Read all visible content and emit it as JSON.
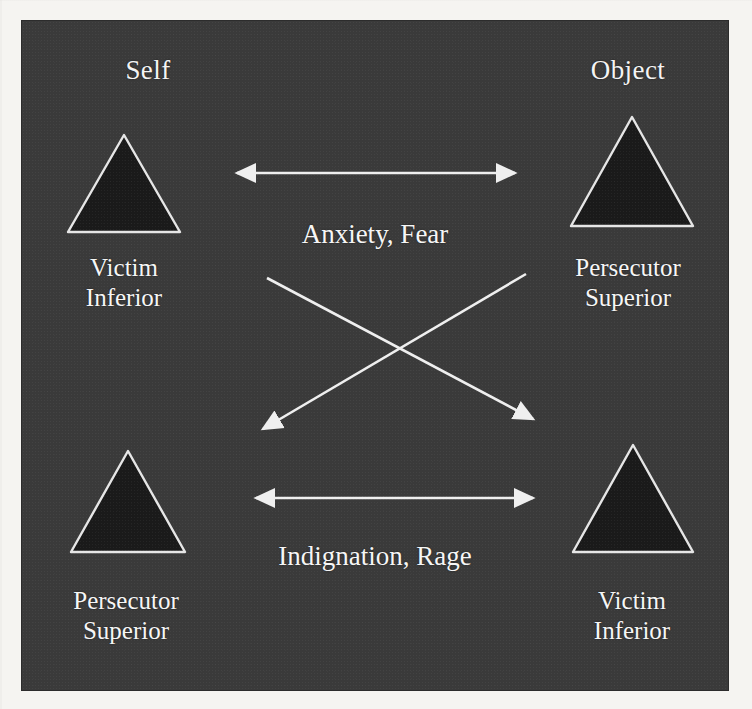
{
  "figure": {
    "panel_background": "#3a3a3a",
    "stroke_color": "#efefef",
    "triangle_fill": "#1a1a1a",
    "text_color": "#f6f6f6"
  },
  "columns": [
    {
      "id": "self",
      "heading": "Self"
    },
    {
      "id": "object",
      "heading": "Object"
    }
  ],
  "nodes": [
    {
      "id": "top-left",
      "column": "self",
      "shape": "triangle",
      "role": "Victim",
      "status": "Inferior"
    },
    {
      "id": "top-right",
      "column": "object",
      "shape": "triangle",
      "role": "Persecutor",
      "status": "Superior"
    },
    {
      "id": "bottom-left",
      "column": "self",
      "shape": "triangle",
      "role": "Persecutor",
      "status": "Superior"
    },
    {
      "id": "bottom-right",
      "column": "object",
      "shape": "triangle",
      "role": "Victim",
      "status": "Inferior"
    }
  ],
  "edges": [
    {
      "id": "top-horizontal",
      "label": "Anxiety, Fear",
      "direction": "bidirectional",
      "from": "top-left",
      "to": "top-right"
    },
    {
      "id": "bottom-horizontal",
      "label": "Indignation, Rage",
      "direction": "bidirectional",
      "from": "bottom-left",
      "to": "bottom-right"
    },
    {
      "id": "diagonal-down-right",
      "label": "",
      "direction": "unidirectional",
      "from": "top-left",
      "to": "bottom-right"
    },
    {
      "id": "diagonal-down-left",
      "label": "",
      "direction": "unidirectional",
      "from": "top-right",
      "to": "bottom-left"
    }
  ]
}
